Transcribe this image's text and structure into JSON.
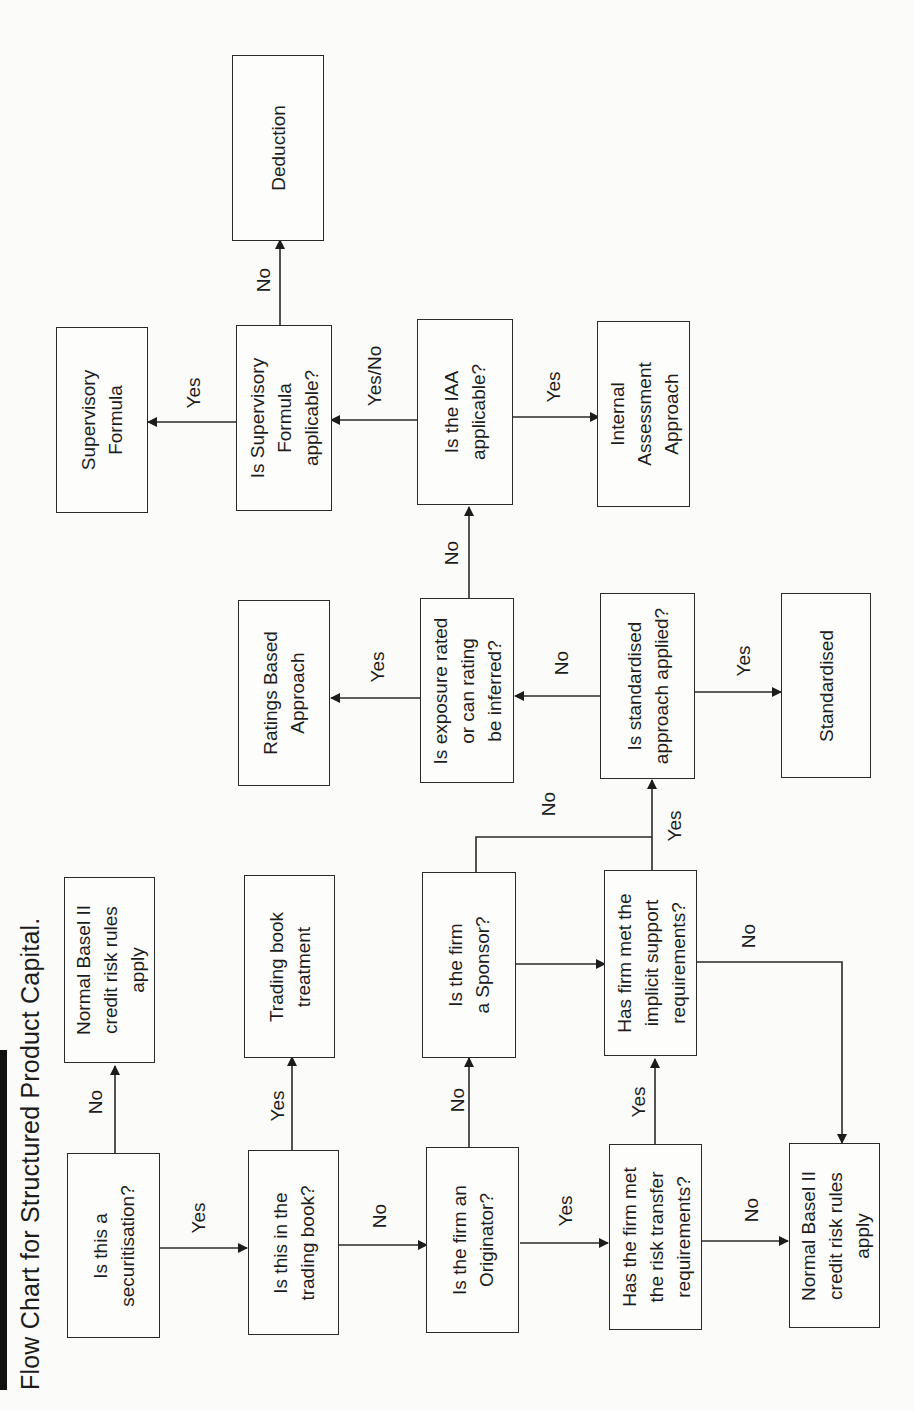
{
  "title": "Flow Chart for Structured Product Capital.",
  "nodes": {
    "securitisation": {
      "text": "Is this a\nsecuritisation?",
      "type": "decision"
    },
    "normal_basel_top": {
      "text": "Normal Basel II\ncredit risk rules\napply",
      "type": "outcome"
    },
    "trading_book_q": {
      "text": "Is this in the\ntrading book?",
      "type": "decision"
    },
    "trading_book_treatment": {
      "text": "Trading book\ntreatment",
      "type": "outcome"
    },
    "originator_q": {
      "text": "Is the firm an\nOriginator?",
      "type": "decision"
    },
    "sponsor_q": {
      "text": "Is the firm\na Sponsor?",
      "type": "decision"
    },
    "risk_transfer_q": {
      "text": "Has the firm met\nthe risk transfer\nrequirements?",
      "type": "decision"
    },
    "implicit_support_q": {
      "text": "Has firm met the\nimplicit support\nrequirements?",
      "type": "decision"
    },
    "normal_basel_bottom": {
      "text": "Normal Basel II\ncredit risk rules\napply",
      "type": "outcome"
    },
    "standardised_q": {
      "text": "Is standardised\napproach applied?",
      "type": "decision"
    },
    "standardised": {
      "text": "Standardised",
      "type": "outcome"
    },
    "exposure_rated_q": {
      "text": "Is exposure rated\nor can rating\nbe inferred?",
      "type": "decision"
    },
    "ratings_based": {
      "text": "Ratings Based\nApproach",
      "type": "outcome"
    },
    "iaa_q": {
      "text": "Is the IAA\napplicable?",
      "type": "decision"
    },
    "internal_assessment": {
      "text": "Internal\nAssessment\nApproach",
      "type": "outcome"
    },
    "supervisory_formula_q": {
      "text": "Is Supervisory\nFormula\napplicable?",
      "type": "decision"
    },
    "supervisory_formula": {
      "text": "Supervisory\nFormula",
      "type": "outcome"
    },
    "deduction": {
      "text": "Deduction",
      "type": "outcome"
    }
  },
  "edges": [
    {
      "from": "securitisation",
      "to": "normal_basel_top",
      "label": "No"
    },
    {
      "from": "securitisation",
      "to": "trading_book_q",
      "label": "Yes"
    },
    {
      "from": "trading_book_q",
      "to": "trading_book_treatment",
      "label": "Yes"
    },
    {
      "from": "trading_book_q",
      "to": "originator_q",
      "label": "No"
    },
    {
      "from": "originator_q",
      "to": "sponsor_q",
      "label": "No"
    },
    {
      "from": "originator_q",
      "to": "risk_transfer_q",
      "label": "Yes"
    },
    {
      "from": "risk_transfer_q",
      "to": "implicit_support_q",
      "label": "Yes"
    },
    {
      "from": "risk_transfer_q",
      "to": "normal_basel_bottom",
      "label": "No"
    },
    {
      "from": "sponsor_q",
      "to": "implicit_support_q",
      "label": ""
    },
    {
      "from": "sponsor_q",
      "to": "standardised_q",
      "label": "No"
    },
    {
      "from": "implicit_support_q",
      "to": "standardised_q",
      "label": "Yes"
    },
    {
      "from": "implicit_support_q",
      "to": "normal_basel_bottom",
      "label": "No"
    },
    {
      "from": "standardised_q",
      "to": "standardised",
      "label": "Yes"
    },
    {
      "from": "standardised_q",
      "to": "exposure_rated_q",
      "label": "No"
    },
    {
      "from": "exposure_rated_q",
      "to": "ratings_based",
      "label": "Yes"
    },
    {
      "from": "exposure_rated_q",
      "to": "iaa_q",
      "label": "No"
    },
    {
      "from": "iaa_q",
      "to": "internal_assessment",
      "label": "Yes"
    },
    {
      "from": "iaa_q",
      "to": "supervisory_formula_q",
      "label": "Yes/No"
    },
    {
      "from": "supervisory_formula_q",
      "to": "supervisory_formula",
      "label": "Yes"
    },
    {
      "from": "supervisory_formula_q",
      "to": "deduction",
      "label": "No"
    }
  ],
  "edge_labels": {
    "sec_no": "No",
    "sec_yes": "Yes",
    "tb_yes": "Yes",
    "tb_no": "No",
    "orig_no": "No",
    "orig_yes": "Yes",
    "rt_yes": "Yes",
    "rt_no": "No",
    "sponsor_no": "No",
    "is_yes": "Yes",
    "is_no": "No",
    "std_yes": "Yes",
    "std_no": "No",
    "exp_yes": "Yes",
    "exp_no": "No",
    "iaa_yes": "Yes",
    "iaa_yesno": "Yes/No",
    "sf_yes": "Yes",
    "sf_no": "No"
  }
}
